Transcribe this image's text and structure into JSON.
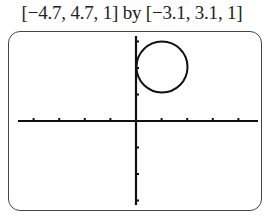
{
  "header": {
    "window_label": "[−4.7, 4.7, 1] by [−3.1, 3.1, 1]"
  },
  "chart_data": {
    "type": "line",
    "title": "[−4.7, 4.7, 1] by [−3.1, 3.1, 1]",
    "xlabel": "",
    "ylabel": "",
    "xlim": [
      -4.7,
      4.7
    ],
    "ylim": [
      -3.1,
      3.1
    ],
    "xscl": 1,
    "yscl": 1,
    "grid": false,
    "axes": true,
    "series": [
      {
        "name": "circle",
        "shape": "circle",
        "center": [
          1,
          2
        ],
        "radius": 1,
        "description": "Circle tangent to the y-axis, lying in quadrant I"
      }
    ],
    "x_ticks": [
      -4,
      -3,
      -2,
      -1,
      1,
      2,
      3,
      4
    ],
    "y_ticks": [
      -3,
      -2,
      -1,
      1,
      2,
      3
    ]
  },
  "colors": {
    "ink": "#111111",
    "frame": "#444444",
    "background": "#ffffff"
  }
}
